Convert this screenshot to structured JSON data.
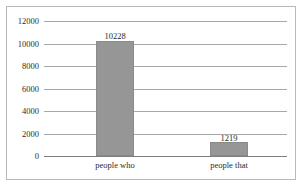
{
  "chart_data": {
    "type": "bar",
    "title": "",
    "xlabel": "",
    "ylabel": "",
    "categories": [
      "people who",
      "people that"
    ],
    "values": [
      10228,
      1219
    ],
    "data_labels": [
      "10228",
      "1219"
    ],
    "ylim": [
      0,
      12000
    ],
    "yticks": [
      0,
      2000,
      4000,
      6000,
      8000,
      10000,
      12000
    ],
    "ytick_labels": [
      "0",
      "2000",
      "4000",
      "6000",
      "8000",
      "10000",
      "12000"
    ],
    "grid": true,
    "legend": false,
    "legend_position": "none",
    "series": [
      {
        "name": "",
        "values": [
          10228,
          1219
        ],
        "color": "#969696"
      }
    ]
  },
  "style": {
    "bar_color": "#969696",
    "bar_border_color": "#8a8a8a",
    "gridline_color": "#a8a8a8",
    "axis_color": "#7d7d7d",
    "frame_color": "#b9b9b9",
    "text_color": "#2b2b2b",
    "background": "#ffffff"
  }
}
